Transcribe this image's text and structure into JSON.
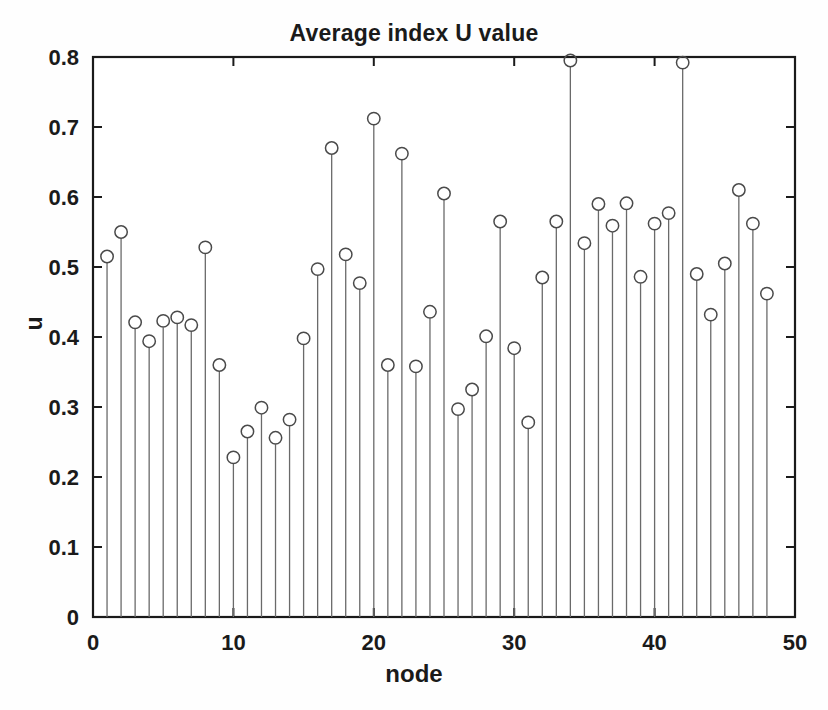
{
  "chart_data": {
    "type": "line",
    "plot_style": "stem",
    "title": "Average index U value",
    "xlabel": "node",
    "ylabel": "u",
    "xlim": [
      0,
      50
    ],
    "ylim": [
      0,
      0.8
    ],
    "xticks": [
      0,
      10,
      20,
      30,
      40,
      50
    ],
    "xtick_labels": [
      "0",
      "10",
      "20",
      "30",
      "40",
      "50"
    ],
    "yticks": [
      0,
      0.1,
      0.2,
      0.3,
      0.4,
      0.5,
      0.6,
      0.7,
      0.8
    ],
    "ytick_labels": [
      "0",
      "0.1",
      "0.2",
      "0.3",
      "0.4",
      "0.5",
      "0.6",
      "0.7",
      "0.8"
    ],
    "grid": false,
    "marker": "circle-open",
    "marker_color": "#4a4a4a",
    "stem_color": "#6a6a6a",
    "axis_color": "#1a1a1a",
    "background": "#ffffff",
    "x": [
      1,
      2,
      3,
      4,
      5,
      6,
      7,
      8,
      9,
      10,
      11,
      12,
      13,
      14,
      15,
      16,
      17,
      18,
      19,
      20,
      21,
      22,
      23,
      24,
      25,
      26,
      27,
      28,
      29,
      30,
      31,
      32,
      33,
      34,
      35,
      36,
      37,
      38,
      39,
      40,
      41,
      42,
      43,
      44,
      45,
      46,
      47,
      48
    ],
    "values": [
      0.515,
      0.55,
      0.421,
      0.394,
      0.423,
      0.428,
      0.417,
      0.528,
      0.36,
      0.228,
      0.265,
      0.299,
      0.256,
      0.282,
      0.398,
      0.497,
      0.67,
      0.518,
      0.477,
      0.712,
      0.36,
      0.662,
      0.358,
      0.436,
      0.605,
      0.297,
      0.325,
      0.401,
      0.565,
      0.384,
      0.278,
      0.485,
      0.565,
      0.795,
      0.534,
      0.59,
      0.559,
      0.591,
      0.486,
      0.562,
      0.577,
      0.792,
      0.49,
      0.432,
      0.505,
      0.61,
      0.562,
      0.462
    ],
    "series": [
      {
        "name": "u",
        "values": [
          0.515,
          0.55,
          0.421,
          0.394,
          0.423,
          0.428,
          0.417,
          0.528,
          0.36,
          0.228,
          0.265,
          0.299,
          0.256,
          0.282,
          0.398,
          0.497,
          0.67,
          0.518,
          0.477,
          0.712,
          0.36,
          0.662,
          0.358,
          0.436,
          0.605,
          0.297,
          0.325,
          0.401,
          0.565,
          0.384,
          0.278,
          0.485,
          0.565,
          0.795,
          0.534,
          0.59,
          0.559,
          0.591,
          0.486,
          0.562,
          0.577,
          0.792,
          0.49,
          0.432,
          0.505,
          0.61,
          0.562,
          0.462
        ]
      }
    ]
  }
}
